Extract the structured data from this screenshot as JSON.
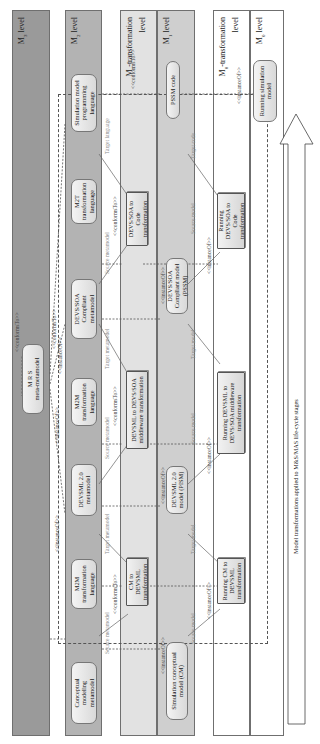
{
  "levels": {
    "m3": {
      "name": "M",
      "sub": "3",
      "suffix": " level"
    },
    "m2": {
      "name": "M",
      "sub": "2",
      "suffix": " level"
    },
    "m1t": {
      "name": "M",
      "sub": "1",
      "suffix": "-transformation",
      "line2": "level"
    },
    "m1": {
      "name": "M",
      "sub": "1",
      "suffix": " level"
    },
    "m0t": {
      "name": "M",
      "sub": "0",
      "suffix": "-transformation",
      "line2": "level"
    },
    "m0": {
      "name": "M",
      "sub": "0",
      "suffix": " level"
    }
  },
  "m3": {
    "meta_metamodel": "M R S\nmeta-metamodel",
    "self_relation": "<<conformsTo>>"
  },
  "m2": {
    "boxes": [
      "Conceptual modeling metamodel",
      "M2M transformation language",
      "DEVSML 2.0 metamodel",
      "M2M transformation language",
      "DEVS/SOA Compliant metamodel",
      "M2T transformation language",
      "Simulation model programming language"
    ]
  },
  "m1t": {
    "transforms": [
      "CM to DEVSML transformation",
      "DEVSML to DEVS/SOA middleware transformation",
      "DEVS/SOA to Code transformation"
    ]
  },
  "m1": {
    "models": [
      "Simulation conceptual model (CM)",
      "DEVSML 2.0 model (PISM)",
      "DEVS/SOA Compliant model (PSSM)",
      "PSSM code"
    ]
  },
  "m0t": {
    "running": [
      "Running CM to DEVSML transformation",
      "Running DEVSML to DEVS/SOA middleware transformation",
      "Running DEVS/SOA to Code transformation"
    ]
  },
  "m0": {
    "running_model": "Running simulation model"
  },
  "relations": {
    "conforms_to": "<<conformsTo>>",
    "instance_of": "<<instanceOf>>",
    "source_metamodel": "Source metamodel",
    "target_metamodel": "Target metamodel",
    "target_language": "Target language",
    "source_model": "Source model",
    "target_model": "Target model",
    "target_code": "Target code"
  },
  "arrow": {
    "label": "Model transformations applied to M&S/MAS life-cycle stages"
  }
}
